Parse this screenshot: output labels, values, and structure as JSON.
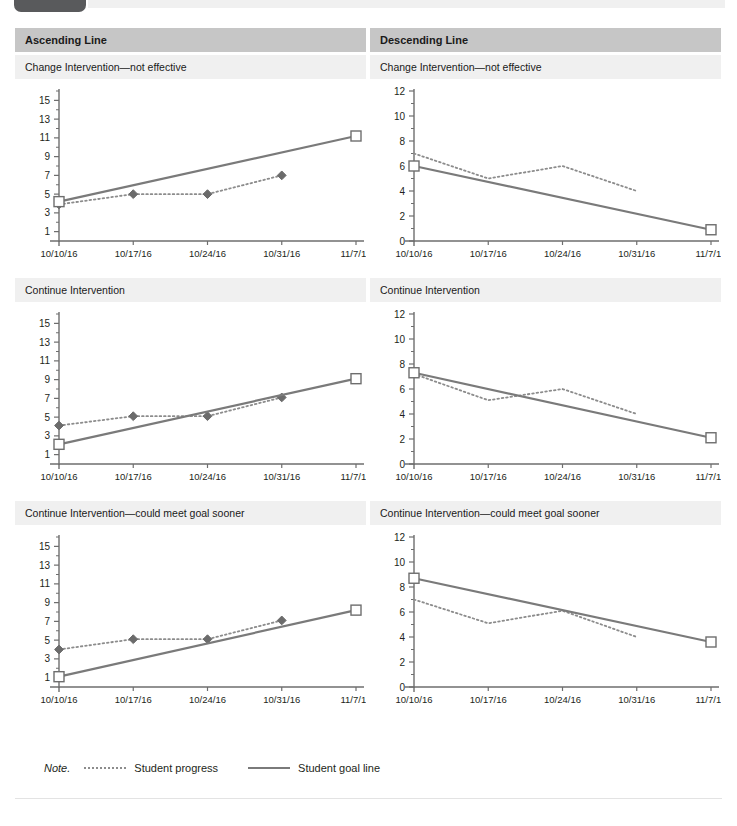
{
  "page": {
    "top_tab_label": "",
    "note_label": "Note.",
    "legend": [
      {
        "key": "student-progress",
        "label": "Student progress",
        "style": "dotted",
        "color": "#8c8c8c"
      },
      {
        "key": "student-goal-line",
        "label": "Student goal line",
        "style": "solid",
        "color": "#7a7a7a"
      }
    ]
  },
  "columns": [
    {
      "title": "Ascending Line"
    },
    {
      "title": "Descending Line"
    }
  ],
  "rows": [
    {
      "subtitle_left": "Change Intervention—not effective",
      "subtitle_right": "Change Intervention—not effective"
    },
    {
      "subtitle_left": "Continue Intervention",
      "subtitle_right": "Continue Intervention"
    },
    {
      "subtitle_left": "Continue Intervention—could meet goal sooner",
      "subtitle_right": "Continue Intervention—could meet goal sooner"
    }
  ],
  "chart_data": [
    {
      "id": "ascending-change-intervention",
      "type": "line",
      "title": "Ascending Line — Change Intervention—not effective",
      "xlabel": "",
      "ylabel": "",
      "x": [
        "10/10/16",
        "10/17/16",
        "10/24/16",
        "10/31/16",
        "11/7/16"
      ],
      "ylim": [
        0,
        16
      ],
      "yticks": [
        1,
        3,
        5,
        7,
        9,
        11,
        13,
        15
      ],
      "yticks_minor": [
        2,
        4,
        6,
        8,
        10,
        12,
        14,
        16
      ],
      "grid": false,
      "legend_position": "bottom",
      "series": [
        {
          "name": "Student progress",
          "style": "dotted",
          "marker": "diamond",
          "values": [
            3.9,
            5.0,
            5.0,
            7.0,
            null
          ]
        },
        {
          "name": "Student goal line",
          "style": "solid",
          "marker": "square-open",
          "values": [
            4.2,
            null,
            null,
            null,
            11.2
          ]
        }
      ]
    },
    {
      "id": "descending-change-intervention",
      "type": "line",
      "title": "Descending Line — Change Intervention—not effective",
      "xlabel": "",
      "ylabel": "",
      "x": [
        "10/10/16",
        "10/17/16",
        "10/24/16",
        "10/31/16",
        "11/7/16"
      ],
      "ylim": [
        0,
        12
      ],
      "yticks": [
        0,
        2,
        4,
        6,
        8,
        10,
        12
      ],
      "yticks_minor": [
        1,
        3,
        5,
        7,
        9,
        11
      ],
      "grid": false,
      "legend_position": "bottom",
      "series": [
        {
          "name": "Student progress",
          "style": "dotted",
          "marker": "none",
          "values": [
            7.0,
            5.0,
            6.0,
            4.0,
            null
          ]
        },
        {
          "name": "Student goal line",
          "style": "solid",
          "marker": "square-open",
          "values": [
            6.0,
            null,
            null,
            null,
            0.9
          ]
        }
      ]
    },
    {
      "id": "ascending-continue-intervention",
      "type": "line",
      "title": "Ascending Line — Continue Intervention",
      "xlabel": "",
      "ylabel": "",
      "x": [
        "10/10/16",
        "10/17/16",
        "10/24/16",
        "10/31/16",
        "11/7/16"
      ],
      "ylim": [
        0,
        16
      ],
      "yticks": [
        1,
        3,
        5,
        7,
        9,
        11,
        13,
        15
      ],
      "yticks_minor": [
        2,
        4,
        6,
        8,
        10,
        12,
        14,
        16
      ],
      "grid": false,
      "legend_position": "bottom",
      "series": [
        {
          "name": "Student progress",
          "style": "dotted",
          "marker": "diamond",
          "values": [
            4.1,
            5.1,
            5.1,
            7.1,
            null
          ]
        },
        {
          "name": "Student goal line",
          "style": "solid",
          "marker": "square-open",
          "values": [
            2.1,
            null,
            null,
            null,
            9.1
          ]
        }
      ]
    },
    {
      "id": "descending-continue-intervention",
      "type": "line",
      "title": "Descending Line — Continue Intervention",
      "xlabel": "",
      "ylabel": "",
      "x": [
        "10/10/16",
        "10/17/16",
        "10/24/16",
        "10/31/16",
        "11/7/16"
      ],
      "ylim": [
        0,
        12
      ],
      "yticks": [
        0,
        2,
        4,
        6,
        8,
        10,
        12
      ],
      "yticks_minor": [
        1,
        3,
        5,
        7,
        9,
        11
      ],
      "grid": false,
      "legend_position": "bottom",
      "series": [
        {
          "name": "Student progress",
          "style": "dotted",
          "marker": "none",
          "values": [
            7.2,
            5.1,
            6.0,
            4.0,
            null
          ]
        },
        {
          "name": "Student goal line",
          "style": "solid",
          "marker": "square-open",
          "values": [
            7.3,
            null,
            null,
            null,
            2.1
          ]
        }
      ]
    },
    {
      "id": "ascending-could-meet-goal-sooner",
      "type": "line",
      "title": "Ascending Line — Continue Intervention—could meet goal sooner",
      "xlabel": "",
      "ylabel": "",
      "x": [
        "10/10/16",
        "10/17/16",
        "10/24/16",
        "10/31/16",
        "11/7/16"
      ],
      "ylim": [
        0,
        16
      ],
      "yticks": [
        1,
        3,
        5,
        7,
        9,
        11,
        13,
        15
      ],
      "yticks_minor": [
        2,
        4,
        6,
        8,
        10,
        12,
        14,
        16
      ],
      "grid": false,
      "legend_position": "bottom",
      "series": [
        {
          "name": "Student progress",
          "style": "dotted",
          "marker": "diamond",
          "values": [
            4.0,
            5.1,
            5.1,
            7.1,
            null
          ]
        },
        {
          "name": "Student goal line",
          "style": "solid",
          "marker": "square-open",
          "values": [
            1.1,
            null,
            null,
            null,
            8.2
          ]
        }
      ]
    },
    {
      "id": "descending-could-meet-goal-sooner",
      "type": "line",
      "title": "Descending Line — Continue Intervention—could meet goal sooner",
      "xlabel": "",
      "ylabel": "",
      "x": [
        "10/10/16",
        "10/17/16",
        "10/24/16",
        "10/31/16",
        "11/7/16"
      ],
      "ylim": [
        0,
        12
      ],
      "yticks": [
        0,
        2,
        4,
        6,
        8,
        10,
        12
      ],
      "yticks_minor": [
        1,
        3,
        5,
        7,
        9,
        11
      ],
      "grid": false,
      "legend_position": "bottom",
      "series": [
        {
          "name": "Student progress",
          "style": "dotted",
          "marker": "none",
          "values": [
            7.0,
            5.1,
            6.1,
            4.0,
            null
          ]
        },
        {
          "name": "Student goal line",
          "style": "solid",
          "marker": "square-open",
          "values": [
            8.7,
            null,
            null,
            null,
            3.6
          ]
        }
      ]
    }
  ],
  "colors": {
    "header_band": "#c6c6c6",
    "subheader_band": "#f0f0f0",
    "axis": "#6e6e6e",
    "progress_line": "#8c8c8c",
    "goal_line": "#7a7a7a",
    "marker_fill": "#6b6b6b",
    "tab": "#595a5c"
  }
}
